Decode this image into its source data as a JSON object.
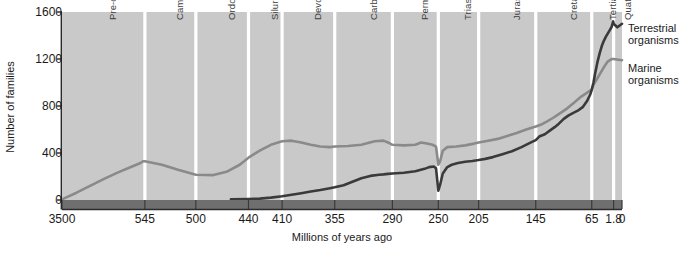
{
  "chart_data": {
    "type": "line",
    "title": "",
    "xlabel": "Millions of years ago",
    "ylabel": "Number of families",
    "ylim": [
      0,
      1600
    ],
    "yticks": [
      0,
      400,
      800,
      1200,
      1600
    ],
    "xticks": [
      "3500",
      "545",
      "500",
      "440",
      "410",
      "355",
      "290",
      "250",
      "205",
      "145",
      "65",
      "1.8",
      "0"
    ],
    "xtick_values": [
      3500,
      545,
      500,
      440,
      410,
      355,
      290,
      250,
      205,
      145,
      65,
      1.8,
      0
    ],
    "x_axis_reversed": true,
    "grid": false,
    "legend_position": "right",
    "series": [
      {
        "name": "Marine organisms",
        "color": "#8a8a8a",
        "points": [
          [
            3500,
            5
          ],
          [
            3000,
            60
          ],
          [
            2500,
            120
          ],
          [
            2000,
            180
          ],
          [
            1500,
            235
          ],
          [
            1000,
            285
          ],
          [
            700,
            315
          ],
          [
            600,
            330
          ],
          [
            545,
            330
          ],
          [
            530,
            300
          ],
          [
            515,
            255
          ],
          [
            500,
            215
          ],
          [
            480,
            212
          ],
          [
            465,
            240
          ],
          [
            450,
            300
          ],
          [
            440,
            360
          ],
          [
            430,
            420
          ],
          [
            420,
            470
          ],
          [
            410,
            500
          ],
          [
            400,
            505
          ],
          [
            390,
            490
          ],
          [
            380,
            470
          ],
          [
            370,
            455
          ],
          [
            360,
            450
          ],
          [
            355,
            455
          ],
          [
            340,
            460
          ],
          [
            325,
            470
          ],
          [
            310,
            500
          ],
          [
            300,
            505
          ],
          [
            295,
            490
          ],
          [
            290,
            470
          ],
          [
            280,
            465
          ],
          [
            270,
            470
          ],
          [
            265,
            490
          ],
          [
            260,
            480
          ],
          [
            255,
            470
          ],
          [
            252,
            455
          ],
          [
            250,
            300
          ],
          [
            248,
            330
          ],
          [
            245,
            420
          ],
          [
            240,
            450
          ],
          [
            230,
            455
          ],
          [
            220,
            465
          ],
          [
            210,
            480
          ],
          [
            205,
            490
          ],
          [
            195,
            505
          ],
          [
            185,
            520
          ],
          [
            175,
            545
          ],
          [
            165,
            570
          ],
          [
            155,
            600
          ],
          [
            145,
            625
          ],
          [
            138,
            640
          ],
          [
            130,
            665
          ],
          [
            120,
            700
          ],
          [
            110,
            740
          ],
          [
            100,
            780
          ],
          [
            90,
            830
          ],
          [
            80,
            880
          ],
          [
            70,
            920
          ],
          [
            65,
            940
          ],
          [
            60,
            980
          ],
          [
            50,
            1030
          ],
          [
            40,
            1080
          ],
          [
            30,
            1130
          ],
          [
            20,
            1175
          ],
          [
            10,
            1195
          ],
          [
            5,
            1200
          ],
          [
            1.8,
            1200
          ],
          [
            0,
            1190
          ]
        ]
      },
      {
        "name": "Terrestrial organisms",
        "color": "#3a3a3a",
        "points": [
          [
            460,
            5
          ],
          [
            440,
            8
          ],
          [
            430,
            12
          ],
          [
            420,
            20
          ],
          [
            410,
            32
          ],
          [
            400,
            45
          ],
          [
            390,
            58
          ],
          [
            380,
            72
          ],
          [
            370,
            85
          ],
          [
            360,
            100
          ],
          [
            355,
            108
          ],
          [
            345,
            125
          ],
          [
            335,
            155
          ],
          [
            325,
            185
          ],
          [
            315,
            205
          ],
          [
            305,
            215
          ],
          [
            300,
            218
          ],
          [
            295,
            222
          ],
          [
            290,
            225
          ],
          [
            280,
            232
          ],
          [
            270,
            245
          ],
          [
            262,
            265
          ],
          [
            258,
            280
          ],
          [
            254,
            285
          ],
          [
            252,
            270
          ],
          [
            250,
            80
          ],
          [
            248,
            130
          ],
          [
            245,
            225
          ],
          [
            240,
            280
          ],
          [
            235,
            300
          ],
          [
            228,
            315
          ],
          [
            220,
            325
          ],
          [
            212,
            332
          ],
          [
            205,
            340
          ],
          [
            198,
            350
          ],
          [
            190,
            365
          ],
          [
            180,
            390
          ],
          [
            170,
            415
          ],
          [
            160,
            450
          ],
          [
            150,
            490
          ],
          [
            145,
            510
          ],
          [
            140,
            540
          ],
          [
            132,
            560
          ],
          [
            125,
            590
          ],
          [
            118,
            620
          ],
          [
            112,
            650
          ],
          [
            105,
            690
          ],
          [
            98,
            720
          ],
          [
            92,
            740
          ],
          [
            85,
            760
          ],
          [
            78,
            790
          ],
          [
            72,
            840
          ],
          [
            67,
            900
          ],
          [
            65,
            940
          ],
          [
            60,
            1000
          ],
          [
            55,
            1080
          ],
          [
            48,
            1180
          ],
          [
            42,
            1250
          ],
          [
            36,
            1310
          ],
          [
            30,
            1355
          ],
          [
            24,
            1390
          ],
          [
            18,
            1420
          ],
          [
            12,
            1450
          ],
          [
            8,
            1470
          ],
          [
            5,
            1500
          ],
          [
            3,
            1520
          ],
          [
            1.8,
            1500
          ],
          [
            1,
            1470
          ],
          [
            0,
            1500
          ]
        ]
      }
    ],
    "periods": [
      {
        "label": "Pre-cambrian",
        "start": 3500,
        "end": 545
      },
      {
        "label": "Cambrian",
        "start": 545,
        "end": 500
      },
      {
        "label": "Ordovician",
        "start": 500,
        "end": 440
      },
      {
        "label": "Silurian",
        "start": 440,
        "end": 410
      },
      {
        "label": "Devonian",
        "start": 410,
        "end": 355
      },
      {
        "label": "Carboniferous",
        "start": 355,
        "end": 290
      },
      {
        "label": "Permian",
        "start": 290,
        "end": 250
      },
      {
        "label": "Triassic",
        "start": 250,
        "end": 205
      },
      {
        "label": "Jurassic",
        "start": 205,
        "end": 145
      },
      {
        "label": "Cretaceous",
        "start": 145,
        "end": 65
      },
      {
        "label": "Tertiary",
        "start": 65,
        "end": 1.8
      },
      {
        "label": "Quaternary",
        "start": 1.8,
        "end": 0
      }
    ],
    "legend": [
      {
        "line1": "Terrestrial",
        "line2": "organisms",
        "color": "#3a3a3a"
      },
      {
        "line1": "Marine",
        "line2": "organisms",
        "color": "#8a8a8a"
      }
    ],
    "colors": {
      "plot_background": "#c9c9c9",
      "divider": "#ffffff",
      "axis_strip": "#6f6f6f",
      "axis_line": "#2b2b2b",
      "text": "#1a1a1a"
    }
  }
}
